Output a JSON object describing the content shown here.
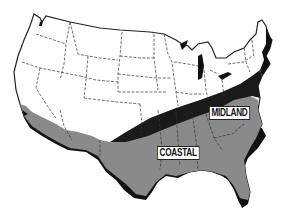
{
  "map": {
    "subject": "Contiguous United States",
    "style": "black-and-white halftone map with dashed state boundaries",
    "regions": [
      {
        "name": "Midland",
        "label": "MIDLAND",
        "fill": "#1a1a1a"
      },
      {
        "name": "Coastal",
        "label": "COASTAL",
        "fill": "#8a8a8a"
      }
    ],
    "colors": {
      "land": "#ffffff",
      "outline": "#222222",
      "state_border": "#333333",
      "midland": "#1a1a1a",
      "coastal": "#8a8a8a",
      "shadow": "#111111"
    }
  },
  "labels": {
    "midland": "MIDLAND",
    "coastal": "COASTAL"
  }
}
